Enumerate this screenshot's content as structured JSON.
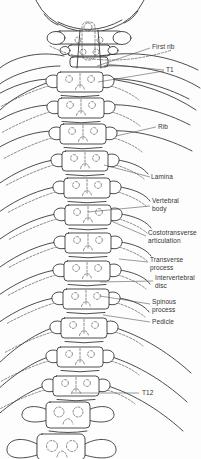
{
  "diagram": {
    "type": "anatomical-line-drawing",
    "labels": {
      "first_rib": "First rib",
      "t1": "T1",
      "rib": "Rib",
      "lamina": "Lamina",
      "vertebral_body": "Vertebral body",
      "costotransverse_articulation": "Costotransverse articulation",
      "transverse_process": "Transverse process",
      "intervertebral_disc": "Intervertebral disc",
      "spinous_process": "Spinous process",
      "pedicle": "Pedicle",
      "t12": "T12"
    },
    "colors": {
      "line": "#2d2d2d",
      "dashed_line": "#3f3f3f",
      "leader_line": "#4a4a4a",
      "text": "#333333",
      "background": "#fdfdfd"
    }
  }
}
